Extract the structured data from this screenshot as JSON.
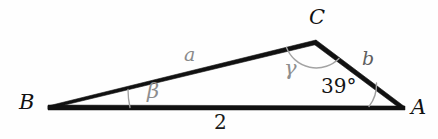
{
  "figure": {
    "kind": "triangle-diagram",
    "background_color": "#fefefe",
    "stroke_color": "#111111",
    "arc_color": "#9a9a9a"
  },
  "vertices": {
    "B": {
      "label": "B",
      "x": 48,
      "y": 106
    },
    "C": {
      "label": "C",
      "x": 316,
      "y": 40
    },
    "A": {
      "label": "A",
      "x": 405,
      "y": 107
    }
  },
  "sides": {
    "BC": {
      "label": "a",
      "color": "#8a8a8a"
    },
    "CA": {
      "label": "b",
      "color": "#5e5e5e"
    },
    "BA": {
      "label": "2",
      "color": "#1a1a1a"
    }
  },
  "angles": {
    "at_B": {
      "label": "β",
      "color": "#8e8e8e"
    },
    "at_C": {
      "label": "γ",
      "color": "#8e8e8e"
    },
    "at_A": {
      "label": "39°",
      "color": "#141414"
    }
  }
}
